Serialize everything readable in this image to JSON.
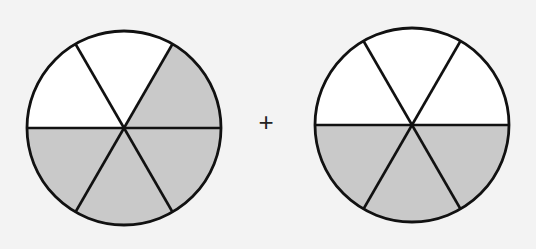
{
  "figure": {
    "operator": "+",
    "colors": {
      "background": "#f3f3f3",
      "shaded": "#c9c9c9",
      "stroke": "#111111",
      "unshaded": "#ffffff"
    },
    "circles": [
      {
        "name": "left",
        "cx": 124,
        "cy": 128,
        "r": 97,
        "parts": 6,
        "shaded_parts": 4,
        "shaded_sectors": [
          "upper-right",
          "lower-right",
          "bottom",
          "lower-left"
        ]
      },
      {
        "name": "right",
        "cx": 412,
        "cy": 125,
        "r": 97,
        "parts": 6,
        "shaded_parts": 3,
        "shaded_sectors": [
          "lower-right",
          "bottom",
          "lower-left"
        ]
      }
    ]
  }
}
